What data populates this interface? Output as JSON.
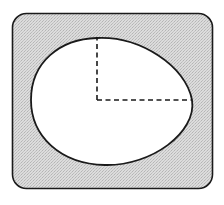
{
  "diagram": {
    "title": "",
    "colors": {
      "background": "#ffffff",
      "frame_fill": "#d9d9d9",
      "hatch": "#b8b8b8",
      "stroke": "#1a1a1a",
      "oval_fill": "#ffffff"
    },
    "frame": {
      "x": 12,
      "y": 13,
      "width": 201,
      "height": 176,
      "corner_radius": 14
    },
    "oval": {
      "top": [
        97,
        38
      ],
      "right": [
        192,
        100
      ],
      "bottom": [
        105,
        165
      ],
      "left": [
        31,
        100
      ]
    },
    "center": [
      97,
      100
    ],
    "dashed_lines": [
      {
        "name": "vertical-radius",
        "from": [
          97,
          100
        ],
        "to": [
          97,
          38
        ]
      },
      {
        "name": "horizontal-radius",
        "from": [
          97,
          100
        ],
        "to": [
          192,
          100
        ]
      }
    ]
  }
}
